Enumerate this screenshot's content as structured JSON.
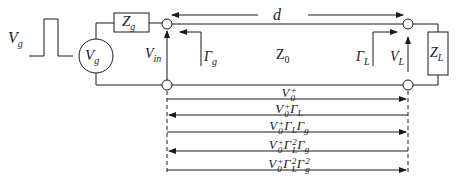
{
  "diagram": {
    "source": {
      "pulse_label": "V",
      "pulse_label_sub": "g",
      "generator_label": "V",
      "generator_label_sub": "g",
      "impedance_label": "Z",
      "impedance_label_sub": "g"
    },
    "line": {
      "length_label": "d",
      "impedance_label": "Z",
      "impedance_label_sub": "0",
      "input_voltage_label": "V",
      "input_voltage_label_sub": "in",
      "gen_reflection_label": "Γ",
      "gen_reflection_label_sub": "g",
      "load_reflection_label": "Γ",
      "load_reflection_label_sub": "L",
      "load_voltage_label": "V",
      "load_voltage_label_sub": "L"
    },
    "load": {
      "impedance_label": "Z",
      "impedance_label_sub": "L"
    },
    "waves": [
      {
        "label": "V0+",
        "direction": "right"
      },
      {
        "label": "V0+ ΓL",
        "direction": "left"
      },
      {
        "label": "V0+ ΓL Γg",
        "direction": "right"
      },
      {
        "label": "V0+ ΓL^2 Γg",
        "direction": "left"
      },
      {
        "label": "V0+ ΓL^2 Γg^2",
        "direction": "right"
      }
    ],
    "colors": {
      "stroke": "#1a1a1a",
      "background": "#ffffff"
    }
  }
}
